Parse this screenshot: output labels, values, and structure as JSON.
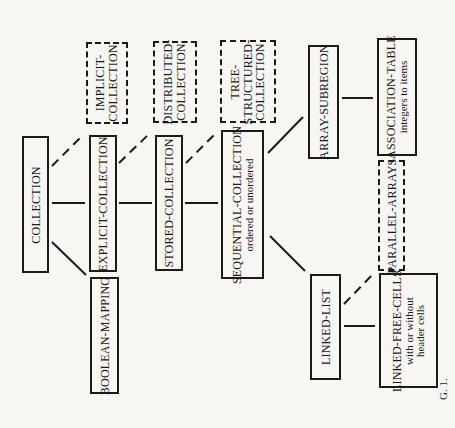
{
  "diagram": {
    "figure_label": "G. 1.",
    "nodes": {
      "collection": {
        "title": "COLLECTION",
        "style": "solid"
      },
      "explicit_collection": {
        "title": "EXPLICIT-COLLECTION",
        "style": "solid"
      },
      "implicit_collection": {
        "title": "IMPLICIT-",
        "title2": "COLLECTION",
        "style": "dashed"
      },
      "boolean_mapping": {
        "title": "BOOLEAN-MAPPING",
        "style": "solid"
      },
      "stored_collection": {
        "title": "STORED-COLLECTION",
        "style": "solid"
      },
      "distributed_collection": {
        "title": "DISTRIBUTED-",
        "title2": "COLLECTION",
        "style": "dashed"
      },
      "sequential_collection": {
        "title": "SEQUENTIAL-COLLECTION",
        "subtitle": "ordered or unordered",
        "style": "solid"
      },
      "tree_structured_collection": {
        "title": "TREE-",
        "title2": "STRUCTURED-",
        "title3": "COLLECTION",
        "style": "dashed"
      },
      "array_subregion": {
        "title": "ARRAY-SUBREGION",
        "style": "solid"
      },
      "association_table": {
        "title": "ASSOCIATION-TABLE",
        "subtitle": "integers to items",
        "style": "solid"
      },
      "linked_list": {
        "title": "LINKED-LIST",
        "style": "solid"
      },
      "parallel_arrays": {
        "title": "PARALLEL-ARRAYS",
        "style": "dashed"
      },
      "linked_free_cells": {
        "title": "LINKED-FREE-CELLS",
        "subtitle": "with or without",
        "subtitle2": "header cells",
        "style": "solid"
      }
    },
    "edges": [
      {
        "from": "collection",
        "to": "explicit_collection",
        "style": "solid"
      },
      {
        "from": "collection",
        "to": "implicit_collection",
        "style": "dashed"
      },
      {
        "from": "collection",
        "to": "boolean_mapping",
        "style": "solid"
      },
      {
        "from": "explicit_collection",
        "to": "stored_collection",
        "style": "solid"
      },
      {
        "from": "explicit_collection",
        "to": "distributed_collection",
        "style": "dashed"
      },
      {
        "from": "stored_collection",
        "to": "sequential_collection",
        "style": "solid"
      },
      {
        "from": "stored_collection",
        "to": "tree_structured_collection",
        "style": "dashed"
      },
      {
        "from": "sequential_collection",
        "to": "array_subregion",
        "style": "solid"
      },
      {
        "from": "sequential_collection",
        "to": "linked_list",
        "style": "solid"
      },
      {
        "from": "array_subregion",
        "to": "association_table",
        "style": "solid"
      },
      {
        "from": "linked_list",
        "to": "linked_free_cells",
        "style": "solid"
      },
      {
        "from": "linked_list",
        "to": "parallel_arrays",
        "style": "dashed"
      }
    ]
  }
}
